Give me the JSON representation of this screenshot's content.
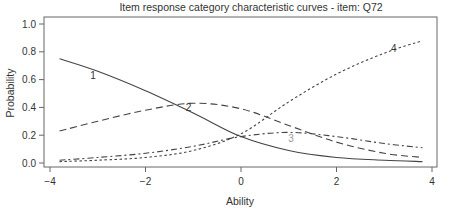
{
  "chart_data": {
    "type": "line",
    "title": "Item response category characteristic curves - item: Q72",
    "xlabel": "Ability",
    "ylabel": "Probability",
    "xlim": [
      -4,
      4
    ],
    "ylim": [
      0,
      1
    ],
    "xticks": [
      "-4",
      "-2",
      "0",
      "2",
      "4"
    ],
    "yticks": [
      "0.0",
      "0.2",
      "0.4",
      "0.6",
      "0.8",
      "1.0"
    ],
    "grid": false,
    "legend": "curve labels inline (1, 2, 3, 4)",
    "x": [
      -3.8,
      -3,
      -2,
      -1,
      0,
      1,
      2,
      3,
      3.8
    ],
    "series": [
      {
        "name": "1",
        "style": "solid",
        "values": [
          0.75,
          0.66,
          0.52,
          0.36,
          0.19,
          0.09,
          0.04,
          0.02,
          0.01
        ]
      },
      {
        "name": "2",
        "style": "dashed",
        "values": [
          0.23,
          0.3,
          0.38,
          0.43,
          0.39,
          0.27,
          0.15,
          0.07,
          0.04
        ]
      },
      {
        "name": "3",
        "style": "dot-dash",
        "values": [
          0.02,
          0.04,
          0.07,
          0.12,
          0.19,
          0.22,
          0.19,
          0.14,
          0.11
        ]
      },
      {
        "name": "4",
        "style": "dotted",
        "values": [
          0.01,
          0.02,
          0.04,
          0.09,
          0.21,
          0.44,
          0.64,
          0.79,
          0.88
        ]
      }
    ]
  }
}
